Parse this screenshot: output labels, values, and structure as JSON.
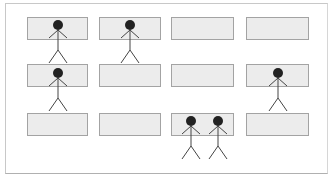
{
  "diagram": {
    "frame": {
      "x": 5,
      "y": 3,
      "w": 323,
      "h": 171,
      "border": "#c8c8c8"
    },
    "box_style": {
      "fill": "#ececec",
      "stroke": "#a3a3a3"
    },
    "figure_style": {
      "head_fill": "#222222",
      "line": "#444444"
    },
    "boxes": [
      {
        "row": 1,
        "col": 1,
        "x": 27,
        "y": 17,
        "w": 60,
        "h": 22
      },
      {
        "row": 1,
        "col": 2,
        "x": 99,
        "y": 17,
        "w": 61,
        "h": 22
      },
      {
        "row": 1,
        "col": 3,
        "x": 171,
        "y": 17,
        "w": 62,
        "h": 22
      },
      {
        "row": 1,
        "col": 4,
        "x": 246,
        "y": 17,
        "w": 62,
        "h": 22
      },
      {
        "row": 2,
        "col": 1,
        "x": 27,
        "y": 64,
        "w": 60,
        "h": 22
      },
      {
        "row": 2,
        "col": 2,
        "x": 99,
        "y": 64,
        "w": 61,
        "h": 22
      },
      {
        "row": 2,
        "col": 3,
        "x": 171,
        "y": 64,
        "w": 62,
        "h": 22
      },
      {
        "row": 2,
        "col": 4,
        "x": 246,
        "y": 64,
        "w": 62,
        "h": 22
      },
      {
        "row": 3,
        "col": 1,
        "x": 27,
        "y": 113,
        "w": 60,
        "h": 22
      },
      {
        "row": 3,
        "col": 2,
        "x": 99,
        "y": 113,
        "w": 61,
        "h": 22
      },
      {
        "row": 3,
        "col": 3,
        "x": 171,
        "y": 113,
        "w": 62,
        "h": 22
      },
      {
        "row": 3,
        "col": 4,
        "x": 246,
        "y": 113,
        "w": 62,
        "h": 22
      }
    ],
    "figures": [
      {
        "box": "r1c1",
        "cx": 58,
        "head_y": 25
      },
      {
        "box": "r1c2",
        "cx": 130,
        "head_y": 25
      },
      {
        "box": "r2c1",
        "cx": 58,
        "head_y": 73
      },
      {
        "box": "r2c4",
        "cx": 278,
        "head_y": 73
      },
      {
        "box": "r3c3",
        "cx": 191,
        "head_y": 121
      },
      {
        "box": "r3c3",
        "cx": 218,
        "head_y": 121
      }
    ]
  }
}
